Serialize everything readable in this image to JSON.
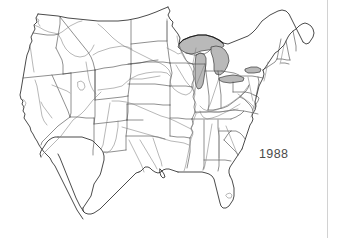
{
  "figure": {
    "kind": "map",
    "region": "Contiguous United States",
    "background_color": "#ffffff",
    "year_label": "1988",
    "year_label_color": "#4b4b4b"
  },
  "map": {
    "title": "",
    "projection_note": "",
    "features": {
      "coastline": "national outline and coastline",
      "state_borders": "state boundary lines",
      "rivers": "major river network",
      "great_lakes": "shaded lake polygons"
    },
    "colors": {
      "coastline": "#2b2b2b",
      "state_border": "#4a4a4a",
      "river": "#7d7d7d",
      "lake_fill": "#b9b9b9",
      "lake_outline": "#1e1e1e",
      "divider": "#d2d2d2"
    },
    "lakes": [
      "Lake Superior",
      "Lake Michigan",
      "Lake Huron",
      "Lake Erie",
      "Lake Ontario"
    ]
  },
  "divider": {
    "label": "right-edge-divider"
  }
}
